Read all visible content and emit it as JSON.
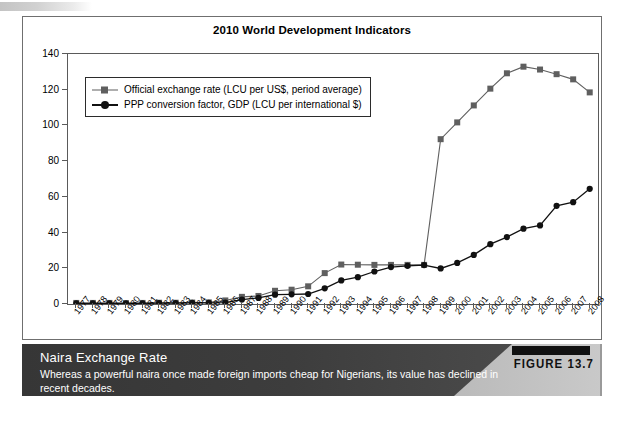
{
  "figure": {
    "badge_bar": "",
    "label": "FIGURE 13.7"
  },
  "caption": {
    "title": "Naira Exchange Rate",
    "body": "Whereas a powerful naira once made foreign imports cheap for Nigerians, its value has declined in recent decades."
  },
  "colors": {
    "series_exchange": "#5f5f5f",
    "series_ppp": "#111111",
    "panel_border": "#6f6f6f",
    "axis": "#5a5a5a",
    "caption_band_dark": "#3a3a3a",
    "caption_band_light": "#a8a8a8",
    "badge_black": "#111111"
  },
  "chart_data": {
    "type": "line",
    "title": "2010 World Development Indicators",
    "xlabel": "",
    "ylabel": "",
    "ylim": [
      0,
      140
    ],
    "yticks": [
      0,
      20,
      40,
      60,
      80,
      100,
      120,
      140
    ],
    "grid": false,
    "legend_position": "top-left-inside",
    "categories": [
      "1977",
      "1978",
      "1979",
      "1980",
      "1981",
      "1982",
      "1983",
      "1984",
      "1985",
      "1986",
      "1987",
      "1988",
      "1989",
      "1990",
      "1991",
      "1992",
      "1993",
      "1994",
      "1995",
      "1996",
      "1997",
      "1998",
      "1999",
      "2000",
      "2001",
      "2002",
      "2003",
      "2004",
      "2005",
      "2006",
      "2007",
      "2008"
    ],
    "series": [
      {
        "name": "Official exchange rate (LCU per US$, period average)",
        "marker": "square",
        "color": "#5f5f5f",
        "values": [
          0.6,
          0.6,
          0.6,
          0.5,
          0.6,
          0.7,
          0.7,
          0.8,
          0.9,
          2.0,
          4.0,
          4.5,
          7.4,
          8.0,
          9.9,
          17.3,
          22.1,
          22.0,
          21.9,
          21.9,
          21.9,
          21.9,
          92.3,
          101.7,
          111.2,
          120.6,
          129.2,
          132.9,
          131.3,
          128.7,
          125.8,
          118.5
        ]
      },
      {
        "name": "PPP conversion factor, GDP (LCU per international $)",
        "marker": "circle",
        "color": "#111111",
        "values": [
          0.4,
          0.4,
          0.4,
          0.4,
          0.4,
          0.5,
          0.5,
          0.6,
          0.6,
          0.8,
          2.5,
          3.4,
          5.2,
          5.4,
          5.6,
          8.8,
          13.2,
          15.0,
          18.2,
          20.7,
          21.4,
          21.8,
          19.9,
          23.0,
          27.5,
          33.5,
          37.5,
          42.2,
          44.0,
          55.0,
          57.0,
          64.5
        ]
      }
    ]
  }
}
